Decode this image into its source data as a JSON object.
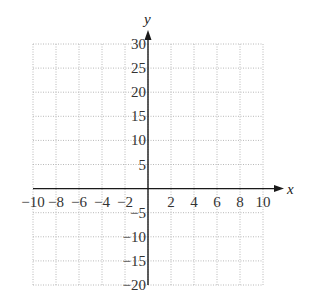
{
  "chart_data": {
    "type": "line",
    "title": "",
    "xlabel": "x",
    "ylabel": "y",
    "xlim": [
      -10,
      10
    ],
    "ylim": [
      -20,
      30
    ],
    "x_ticks": [
      -10,
      -8,
      -6,
      -4,
      -2,
      2,
      4,
      6,
      8,
      10
    ],
    "x_tick_labels": [
      "−10",
      "−8",
      "−6",
      "−4",
      "−2",
      "2",
      "4",
      "6",
      "8",
      "10"
    ],
    "y_ticks": [
      30,
      25,
      20,
      15,
      10,
      5,
      -5,
      -10,
      -15,
      -20
    ],
    "y_tick_labels": [
      "30",
      "25",
      "20",
      "15",
      "10",
      "5",
      "−5",
      "−10",
      "−15",
      "−20"
    ],
    "x_grid_step": 2,
    "y_grid_step": 5,
    "grid": true,
    "grid_style": "dotted",
    "series": [],
    "legend": null
  },
  "colors": {
    "axis": "#1a1a1a",
    "grid": "#b8b8b8",
    "label": "#333333"
  }
}
